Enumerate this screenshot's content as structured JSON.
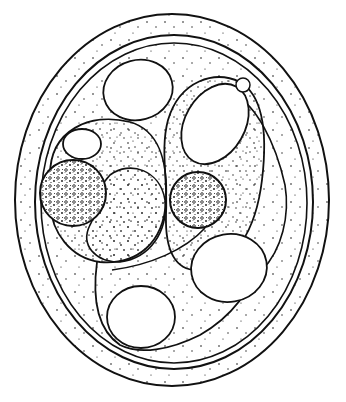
{
  "figure": {
    "title": "",
    "caption": "",
    "colors": {
      "background": "#ffffff",
      "ink": "#111111"
    },
    "structures": [
      {
        "name": "oocyst-outer-wall",
        "cx": 172,
        "cy": 200,
        "rx": 157,
        "ry": 186
      },
      {
        "name": "oocyst-inner-wall",
        "cx": 174,
        "cy": 202,
        "rx": 139,
        "ry": 167
      },
      {
        "name": "residual-body-left",
        "cx": 73,
        "cy": 193,
        "r": 33
      },
      {
        "name": "residual-body-right",
        "cx": 198,
        "cy": 200,
        "r": 28
      }
    ]
  }
}
